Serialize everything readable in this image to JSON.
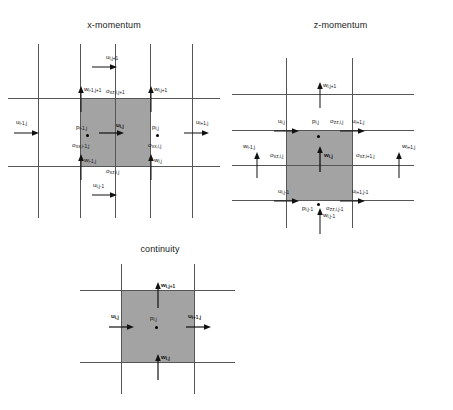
{
  "figure": {
    "background": "#ffffff",
    "cell_fill_color": "#a3a3a3",
    "grid_color": "#555555",
    "text_color": "#101010"
  },
  "panels": [
    {
      "id": "x-momentum",
      "title": "x-momentum",
      "labels": {
        "u_top": "u",
        "u_top_sub": "i,j+1",
        "u_left": "u",
        "u_left_sub": "i-1,j",
        "u_right": "u",
        "u_right_sub": "i+1,j",
        "u_bottom": "u",
        "u_bottom_sub": "i,j-1",
        "u_center": "u",
        "u_center_sub": "i,j",
        "w_topleft": "w",
        "w_topleft_sub": "i-1,j+1",
        "w_topright": "w",
        "w_topright_sub": "i,j+1",
        "w_botleft": "w",
        "w_botleft_sub": "i-1,j",
        "w_botright": "w",
        "w_botright_sub": "i,j",
        "p_left": "p",
        "p_left_sub": "i-1,j",
        "p_right": "p",
        "p_right_sub": "i,j",
        "sig_xx_left": "σ",
        "sig_xx_left_sub": "xx,i-1,j",
        "sig_xx_right": "σ",
        "sig_xx_right_sub": "xx,i,j",
        "sig_xz_top": "σ",
        "sig_xz_top_sub": "xz,i,j+1",
        "sig_xz_bottom": "σ",
        "sig_xz_bottom_sub": "xz,i,j"
      }
    },
    {
      "id": "z-momentum",
      "title": "z-momentum",
      "labels": {
        "w_top": "w",
        "w_top_sub": "i,j+1",
        "w_left": "w",
        "w_left_sub": "i-1,j",
        "w_right": "w",
        "w_right_sub": "i+1,j",
        "w_bottom": "w",
        "w_bottom_sub": "i,j-1",
        "w_center": "w",
        "w_center_sub": "i,j",
        "u_topleft": "u",
        "u_topleft_sub": "i,j",
        "u_topright": "u",
        "u_topright_sub": "i+1,j",
        "u_botleft": "u",
        "u_botleft_sub": "i,j-1",
        "u_botright": "u",
        "u_botright_sub": "i+1,j-1",
        "p_top": "p",
        "p_top_sub": "i,j",
        "p_bottom": "p",
        "p_bottom_sub": "i,j-1",
        "sig_zz_top": "σ",
        "sig_zz_top_sub": "zz,i,j",
        "sig_zz_bottom": "σ",
        "sig_zz_bottom_sub": "zz,i,j-1",
        "sig_xz_left": "σ",
        "sig_xz_left_sub": "xz,i,j",
        "sig_xz_right": "σ",
        "sig_xz_right_sub": "xz,i+1,j"
      }
    },
    {
      "id": "continuity",
      "title": "continuity",
      "labels": {
        "u_left": "u",
        "u_left_sub": "i,j",
        "u_right": "u",
        "u_right_sub": "i+1,j",
        "w_top": "w",
        "w_top_sub": "i,j+1",
        "w_bottom": "w",
        "w_bottom_sub": "i,j",
        "p_center": "p",
        "p_center_sub": "i,j"
      }
    }
  ]
}
